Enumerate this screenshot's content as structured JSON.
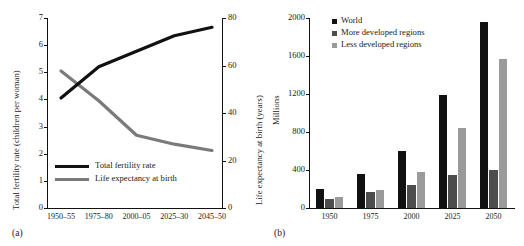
{
  "figure": {
    "panel_a_label": "(a)",
    "panel_b_label": "(b)"
  },
  "chart_data": [
    {
      "id": "panel-a",
      "type": "line",
      "title": "",
      "panel_label": "(a)",
      "xlabel": "",
      "categories": [
        "1950–55",
        "1975–80",
        "2000–05",
        "2025–30",
        "2045–50"
      ],
      "grid": false,
      "legend_position": "lower-center",
      "axes": {
        "left": {
          "label": "Total fertility rate (children per woman)",
          "ylim": [
            0,
            7
          ],
          "ticks": [
            0,
            1,
            2,
            3,
            4,
            5,
            6,
            7
          ],
          "tick_labels": [
            "0",
            "1",
            "2",
            "3",
            "4",
            "5",
            "6",
            "7"
          ]
        },
        "right": {
          "label": "Life expectancy at birth (years)",
          "ylim": [
            0,
            80
          ],
          "ticks": [
            0,
            20,
            40,
            60,
            80
          ],
          "tick_labels": [
            "0",
            "20",
            "40",
            "60",
            "80"
          ]
        }
      },
      "series": [
        {
          "name": "Total fertility rate",
          "axis": "left",
          "color": "#7a7a7a",
          "values": [
            5.05,
            3.95,
            2.68,
            2.35,
            2.12
          ]
        },
        {
          "name": "Life expectancy at birth",
          "axis": "right",
          "color": "#111111",
          "values": [
            46.3,
            59.5,
            66.0,
            72.5,
            76.1
          ]
        }
      ]
    },
    {
      "id": "panel-b",
      "type": "bar",
      "title": "",
      "panel_label": "(b)",
      "xlabel": "",
      "ylabel": "Millions",
      "ylim": [
        0,
        2000
      ],
      "yticks": [
        0,
        400,
        800,
        1200,
        1600,
        2000
      ],
      "ytick_labels": [
        "0",
        "400",
        "800",
        "1200",
        "1600",
        "2000"
      ],
      "categories": [
        "1950",
        "1975",
        "2000",
        "2025",
        "2050"
      ],
      "grid": false,
      "legend_position": "upper-left",
      "series": [
        {
          "name": "World",
          "color": "#111111",
          "values": [
            205,
            355,
            605,
            1185,
            1955
          ]
        },
        {
          "name": "More developed regions",
          "color": "#4d4d4d",
          "values": [
            95,
            165,
            240,
            345,
            400
          ]
        },
        {
          "name": "Less developed regions",
          "color": "#9a9a9a",
          "values": [
            115,
            185,
            375,
            840,
            1565
          ]
        }
      ]
    }
  ]
}
